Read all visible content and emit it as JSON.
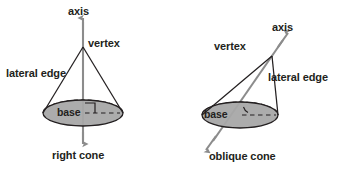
{
  "figure": {
    "background_color": "#ffffff",
    "stroke_color": "#231f20",
    "axis_arrow_color": "#8c8c8c",
    "base_fill_color": "#a8a8a8",
    "base_stroke_color": "#231f20",
    "text_color": "#231f20"
  },
  "cones": [
    {
      "id": "right-cone",
      "caption": "right cone",
      "labels": {
        "axis": "axis",
        "vertex": "vertex",
        "lateral_edge": "lateral edge",
        "base": "base"
      },
      "geometry": {
        "apex_x": 83,
        "apex_y": 47,
        "base_center_x": 83,
        "base_center_y": 113,
        "base_rx": 40,
        "base_ry": 13,
        "axis_top_y": 15,
        "axis_bottom_y": 146,
        "right_angle_marker": true,
        "angle_arc_marker": false
      }
    },
    {
      "id": "oblique-cone",
      "caption": "oblique cone",
      "labels": {
        "axis": "axis",
        "vertex": "vertex",
        "lateral_edge": "lateral edge",
        "base": "base"
      },
      "geometry": {
        "apex_x": 272,
        "apex_y": 56,
        "base_center_x": 240,
        "base_center_y": 115,
        "base_rx": 38,
        "base_ry": 13,
        "axis_top_x": 288,
        "axis_top_y": 33,
        "axis_bottom_x": 208,
        "axis_bottom_y": 148,
        "right_angle_marker": false,
        "angle_arc_marker": true
      }
    }
  ],
  "label_positions": {
    "right_cone": {
      "axis": {
        "x": 68,
        "y": 6
      },
      "vertex": {
        "x": 88,
        "y": 38
      },
      "lateral_edge": {
        "x": 6,
        "y": 68
      },
      "base": {
        "x": 57,
        "y": 107
      },
      "caption": {
        "x": 52,
        "y": 150
      }
    },
    "oblique_cone": {
      "axis": {
        "x": 272,
        "y": 22
      },
      "vertex": {
        "x": 214,
        "y": 41
      },
      "lateral_edge": {
        "x": 268,
        "y": 72
      },
      "base": {
        "x": 204,
        "y": 109
      },
      "caption": {
        "x": 209,
        "y": 151
      }
    }
  }
}
